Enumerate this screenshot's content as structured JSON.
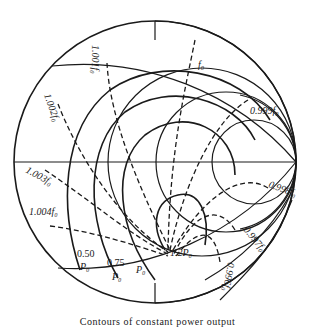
{
  "diagram": {
    "caption": "Contours of constant power output",
    "frequency_labels": {
      "f0": "f₀",
      "f1001": "1.001f₀",
      "f1002": "1.002f₀",
      "f1003": "1.003f₀",
      "f1004": "1.004f₀",
      "f0999": "0.999f₀",
      "f0998": "0.998f₀",
      "f0997": "0.997f₀",
      "f0996": "0.996f₀"
    },
    "power_labels": {
      "p050_num": "0.50",
      "p050_unit": "P₀",
      "p075_num": "0.75",
      "p075_unit": "P₀",
      "p100": "P₀",
      "p120": "1.2P₀"
    },
    "line_color": "#1a1a1a",
    "background": "#ffffff"
  }
}
